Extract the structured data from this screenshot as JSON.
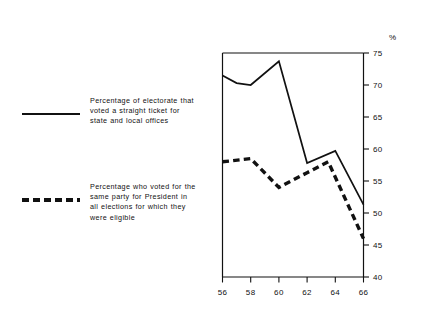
{
  "chart_data": {
    "type": "line",
    "title": "",
    "subtitle": "",
    "xlabel": "",
    "ylabel": "",
    "unit_label": "%",
    "x": [
      56,
      58,
      60,
      62,
      64,
      66
    ],
    "categories": [
      "56",
      "58",
      "60",
      "62",
      "64",
      "66"
    ],
    "xtick_labels": [
      "56",
      "58",
      "60",
      "62",
      "64",
      "66"
    ],
    "ytick_labels": [
      "40",
      "45",
      "50",
      "55",
      "60",
      "65",
      "70",
      "75"
    ],
    "ytick_values": [
      40,
      45,
      50,
      55,
      60,
      65,
      70,
      75
    ],
    "xlim": [
      56,
      66
    ],
    "ylim": [
      40,
      75
    ],
    "grid": false,
    "legend_position": "left-outside",
    "series": [
      {
        "name": "Percentage of electorate that voted a straight ticket for state and local offices",
        "style": "solid",
        "color": "#111111",
        "x": [
          56,
          57,
          58,
          60,
          62,
          64,
          66
        ],
        "values": [
          71.5,
          70.3,
          70.0,
          73.7,
          57.8,
          59.7,
          51.3
        ]
      },
      {
        "name": "Percentage who voted for the same party for President in all elections for which they were eligible",
        "style": "dashed",
        "color": "#111111",
        "x": [
          56,
          58,
          60,
          62,
          63.5,
          66
        ],
        "values": [
          58.0,
          58.5,
          54.0,
          56.3,
          58.0,
          46.0
        ]
      }
    ]
  },
  "legend": {
    "entries": [
      {
        "swatch": "solid-line-swatch",
        "lines": [
          "Percentage of electorate that",
          "voted a straight ticket for",
          "state and local offices"
        ]
      },
      {
        "swatch": "dashed-line-swatch",
        "lines": [
          "Percentage who voted for the",
          "same party for President in",
          "all elections for which they",
          "were eligible"
        ]
      }
    ]
  },
  "axes": {
    "unit_label": "%",
    "y_ticks": [
      "75",
      "70",
      "65",
      "60",
      "55",
      "50",
      "45",
      "40"
    ],
    "x_ticks": [
      "56",
      "58",
      "60",
      "62",
      "64",
      "66"
    ]
  },
  "colors": {
    "ink": "#111111",
    "background": "#ffffff"
  }
}
